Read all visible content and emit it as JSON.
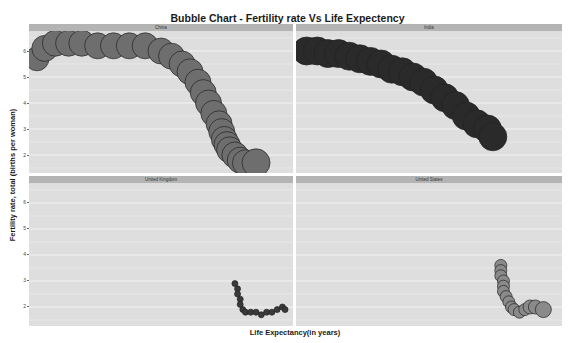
{
  "chart_data": {
    "type": "scatter",
    "subtype": "bubble-faceted",
    "title": "Bubble Chart - Fertility rate Vs Life Expectency",
    "xlabel": "Life Expectancy(in years)",
    "ylabel": "Fertility rate, total (births per woman)",
    "y_ticks": [
      2,
      3,
      4,
      5,
      6
    ],
    "ylim": [
      1.5,
      6.5
    ],
    "x_ticks": [],
    "grid": true,
    "legend": "none",
    "facets": [
      {
        "name": "China",
        "color": "#6e6e6e",
        "points": [
          [
            0.03,
            5.7,
            12
          ],
          [
            0.06,
            6.1,
            13
          ],
          [
            0.1,
            6.3,
            13
          ],
          [
            0.15,
            6.3,
            13
          ],
          [
            0.2,
            6.3,
            13
          ],
          [
            0.26,
            6.2,
            13
          ],
          [
            0.32,
            6.2,
            13
          ],
          [
            0.38,
            6.2,
            13
          ],
          [
            0.44,
            6.2,
            13
          ],
          [
            0.5,
            6.0,
            13
          ],
          [
            0.54,
            5.8,
            13
          ],
          [
            0.58,
            5.5,
            13
          ],
          [
            0.61,
            5.2,
            13
          ],
          [
            0.64,
            4.8,
            13
          ],
          [
            0.66,
            4.4,
            13
          ],
          [
            0.68,
            4.0,
            13
          ],
          [
            0.7,
            3.6,
            13
          ],
          [
            0.72,
            3.2,
            13
          ],
          [
            0.73,
            2.9,
            13
          ],
          [
            0.74,
            2.6,
            13
          ],
          [
            0.75,
            2.4,
            13
          ],
          [
            0.76,
            2.2,
            13
          ],
          [
            0.78,
            2.0,
            13
          ],
          [
            0.8,
            1.8,
            13
          ],
          [
            0.82,
            1.7,
            13
          ],
          [
            0.86,
            1.7,
            14
          ]
        ]
      },
      {
        "name": "India",
        "color": "#2a2a2a",
        "points": [
          [
            0.04,
            6.0,
            14
          ],
          [
            0.08,
            6.0,
            14
          ],
          [
            0.12,
            5.9,
            14
          ],
          [
            0.16,
            5.9,
            14
          ],
          [
            0.2,
            5.8,
            14
          ],
          [
            0.24,
            5.7,
            14
          ],
          [
            0.28,
            5.6,
            14
          ],
          [
            0.32,
            5.5,
            14
          ],
          [
            0.36,
            5.3,
            14
          ],
          [
            0.4,
            5.2,
            14
          ],
          [
            0.44,
            5.0,
            14
          ],
          [
            0.48,
            4.8,
            14
          ],
          [
            0.52,
            4.5,
            14
          ],
          [
            0.56,
            4.2,
            14
          ],
          [
            0.6,
            3.9,
            14
          ],
          [
            0.64,
            3.5,
            14
          ],
          [
            0.68,
            3.2,
            14
          ],
          [
            0.72,
            3.0,
            14
          ],
          [
            0.74,
            2.7,
            14
          ]
        ]
      },
      {
        "name": "United Kingdom",
        "color": "#3a3a3a",
        "points": [
          [
            0.78,
            2.9,
            3
          ],
          [
            0.79,
            2.7,
            3
          ],
          [
            0.79,
            2.5,
            3
          ],
          [
            0.8,
            2.3,
            3
          ],
          [
            0.8,
            2.1,
            3
          ],
          [
            0.81,
            1.9,
            3
          ],
          [
            0.82,
            1.8,
            3
          ],
          [
            0.84,
            1.8,
            3
          ],
          [
            0.86,
            1.8,
            3
          ],
          [
            0.88,
            1.7,
            3
          ],
          [
            0.9,
            1.8,
            3
          ],
          [
            0.92,
            1.8,
            3
          ],
          [
            0.94,
            1.9,
            3
          ],
          [
            0.96,
            2.0,
            3
          ],
          [
            0.97,
            1.9,
            3
          ]
        ]
      },
      {
        "name": "United States",
        "color": "#8a8a8a",
        "points": [
          [
            0.77,
            3.6,
            6
          ],
          [
            0.77,
            3.4,
            6
          ],
          [
            0.77,
            3.2,
            6
          ],
          [
            0.78,
            3.0,
            6
          ],
          [
            0.78,
            2.8,
            6
          ],
          [
            0.78,
            2.6,
            6
          ],
          [
            0.79,
            2.4,
            6
          ],
          [
            0.8,
            2.2,
            6
          ],
          [
            0.81,
            2.0,
            6
          ],
          [
            0.82,
            1.9,
            6
          ],
          [
            0.84,
            1.8,
            6
          ],
          [
            0.86,
            1.9,
            6
          ],
          [
            0.88,
            2.0,
            7
          ],
          [
            0.9,
            2.0,
            7
          ],
          [
            0.93,
            1.9,
            8
          ]
        ]
      }
    ]
  },
  "header": {
    "title": "Bubble Chart - Fertility rate Vs Life Expectency"
  },
  "axes": {
    "xlabel": "Life Expectancy(in years)",
    "ylabel": "Fertility rate, total (births per woman)",
    "y_tick_labels": [
      "6",
      "5",
      "4",
      "3",
      "2"
    ]
  },
  "panels": [
    {
      "label": "China"
    },
    {
      "label": "India"
    },
    {
      "label": "United Kingdom"
    },
    {
      "label": "United States"
    }
  ]
}
